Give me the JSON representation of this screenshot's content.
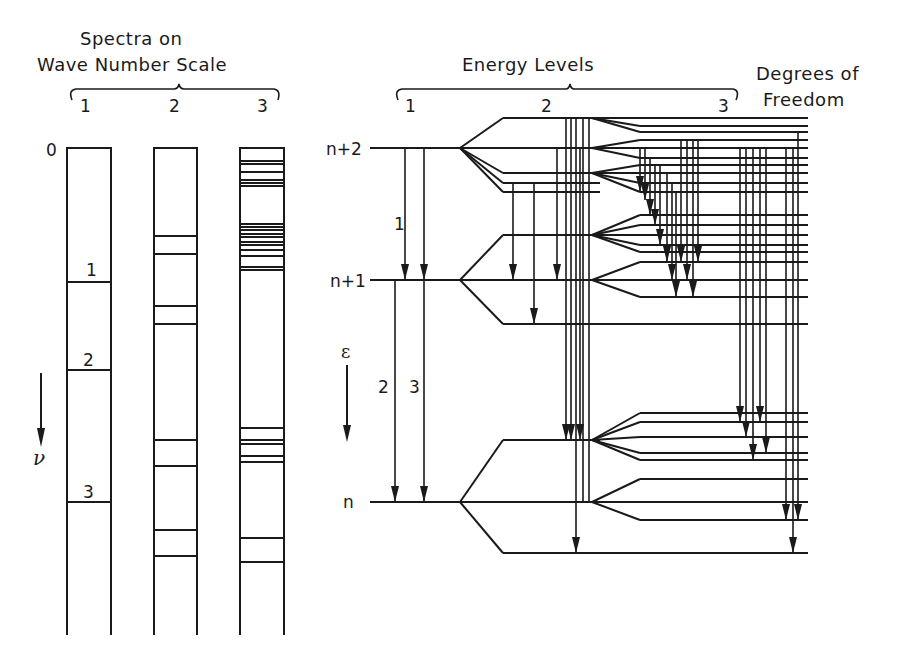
{
  "left_panel": {
    "title_line1": "Spectra  on",
    "title_line2": "Wave  Number  Scale",
    "column_labels": [
      "1",
      "2",
      "3"
    ],
    "zero_label": "0",
    "axis_symbol": "ν",
    "columns": [
      {
        "id": "1",
        "x": 67,
        "w": 44,
        "lines": [
          282,
          370,
          502
        ],
        "line_labels": [
          {
            "text": "1",
            "y": 268
          },
          {
            "text": "2",
            "y": 358
          },
          {
            "text": "3",
            "y": 492
          }
        ]
      },
      {
        "id": "2",
        "x": 154,
        "w": 43,
        "lines": [
          236,
          254,
          306,
          324,
          440,
          466,
          530,
          556
        ],
        "line_labels": []
      },
      {
        "id": "3",
        "x": 240,
        "w": 44,
        "lines": [
          161,
          164,
          172,
          180,
          183,
          186,
          224,
          227,
          230,
          234,
          237,
          242,
          245,
          250,
          256,
          267,
          270,
          428,
          440,
          444,
          456,
          462,
          538,
          562
        ],
        "line_labels": []
      }
    ],
    "top_y": 148,
    "bottom_y": 635
  },
  "right_panel": {
    "title": "Energy  Levels",
    "column_labels": [
      "1",
      "2",
      "3"
    ],
    "side_title_line1": "Degrees  of",
    "side_title_line2": "Freedom",
    "level_labels": [
      "n+2",
      "n+1",
      "n"
    ],
    "transition_labels": [
      "1",
      "2",
      "3"
    ],
    "axis_symbol": "ε",
    "levels": {
      "n+2": 148,
      "n+1": 280,
      "n": 502
    }
  }
}
